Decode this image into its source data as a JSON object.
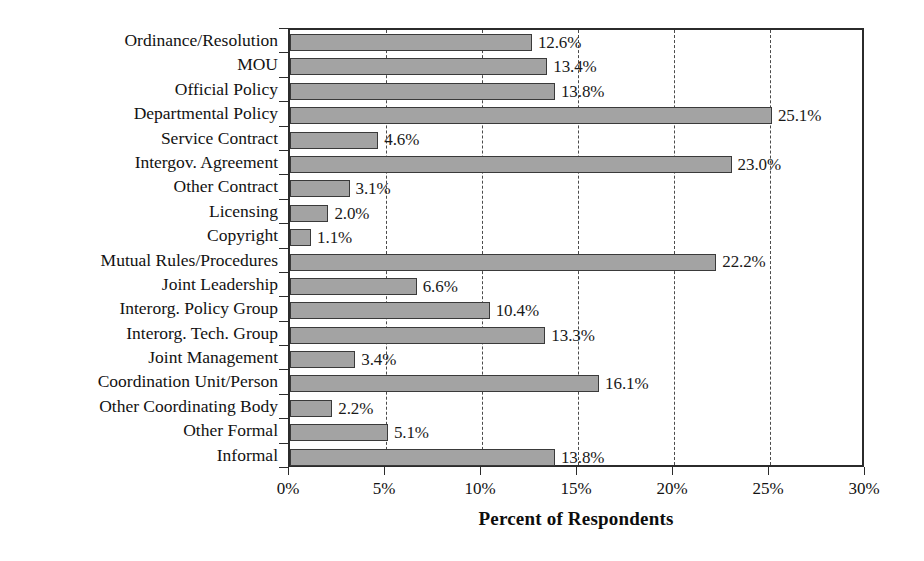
{
  "chart_data": {
    "type": "bar",
    "orientation": "horizontal",
    "title": "",
    "xlabel": "Percent of Respondents",
    "ylabel": "",
    "xlim": [
      0,
      30
    ],
    "xticks": [
      0,
      5,
      10,
      15,
      20,
      25,
      30
    ],
    "xtick_labels": [
      "0%",
      "5%",
      "10%",
      "15%",
      "20%",
      "25%",
      "30%"
    ],
    "grid": "vertical-dashed",
    "legend": "none",
    "categories": [
      "Ordinance/Resolution",
      "MOU",
      "Official Policy",
      "Departmental Policy",
      "Service Contract",
      "Intergov. Agreement",
      "Other Contract",
      "Licensing",
      "Copyright",
      "Mutual Rules/Procedures",
      "Joint Leadership",
      "Interorg. Policy Group",
      "Interorg. Tech. Group",
      "Joint Management",
      "Coordination Unit/Person",
      "Other Coordinating Body",
      "Other Formal",
      "Informal"
    ],
    "values": [
      12.6,
      13.4,
      13.8,
      25.1,
      4.6,
      23.0,
      3.1,
      2.0,
      1.1,
      22.2,
      6.6,
      10.4,
      13.3,
      3.4,
      16.1,
      2.2,
      5.1,
      13.8
    ],
    "value_labels": [
      "12.6%",
      "13.4%",
      "13.8%",
      "25.1%",
      "4.6%",
      "23.0%",
      "3.1%",
      "2.0%",
      "1.1%",
      "22.2%",
      "6.6%",
      "10.4%",
      "13.3%",
      "3.4%",
      "16.1%",
      "2.2%",
      "5.1%",
      "13.8%"
    ],
    "colors": {
      "bar_fill": "#a3a3a3",
      "bar_border": "#3a3a3a",
      "axis": "#2b2b2b",
      "grid": "#4a4a4a",
      "text": "#121212",
      "background": "#ffffff"
    }
  }
}
